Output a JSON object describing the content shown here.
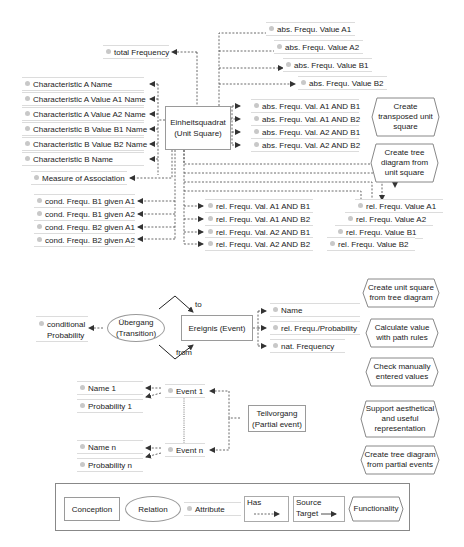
{
  "unit_square": {
    "concept": {
      "line1": "Einheitsquadrat",
      "line2": "(Unit Square)"
    },
    "total_frequency": "total Frequency",
    "characteristics": [
      "Characteristic A Name",
      "Characteristic A Value A1 Name",
      "Characteristic A Value A2 Name",
      "Characteristic B Value B1 Name",
      "Characteristic B Value B2 Name",
      "Characteristic B Name"
    ],
    "measure_of_association": "Measure of Association",
    "conditional": [
      "cond. Frequ. B1 given A1",
      "cond. Frequ. B1 given A2",
      "cond. Frequ. B2 given A1",
      "cond. Frequ. B2 given A2"
    ],
    "abs_values": [
      "abs. Frequ. Value A1",
      "abs. Frequ. Value A2",
      "abs. Frequ. Value B1",
      "abs. Frequ. Value B2"
    ],
    "abs_joint": [
      "abs. Frequ. Val. A1 AND B1",
      "abs. Frequ. Val. A1 AND B2",
      "abs. Frequ. Val. A2 AND B1",
      "abs. Frequ. Val. A2 AND B2"
    ],
    "rel_joint": [
      "rel. Frequ. Val. A1 AND B1",
      "rel. Frequ. Val. A1 AND B2",
      "rel. Frequ. Val. A2 AND B1",
      "rel. Frequ. Val. A2 AND B2"
    ],
    "rel_values": [
      "rel. Frequ. Value A1",
      "rel. Frequ. Value A2",
      "rel. Frequ. Value B1",
      "rel. Frequ. Value B2"
    ]
  },
  "functionalities": [
    {
      "line1": "Create",
      "line2": "transposed unit",
      "line3": "square"
    },
    {
      "line1": "Create tree",
      "line2": "diagram from",
      "line3": "unit square"
    },
    {
      "line1": "Create unit square",
      "line2": "from tree diagram"
    },
    {
      "line1": "Calculate value",
      "line2": "with path rules"
    },
    {
      "line1": "Check manually",
      "line2": "entered values"
    },
    {
      "line1": "Support aesthetical",
      "line2": "and useful",
      "line3": "representation"
    },
    {
      "line1": "Create tree diagram",
      "line2": "from partial events"
    }
  ],
  "tree": {
    "transition": {
      "line1": "Übergang",
      "line2": "(Transition)"
    },
    "conditional_probability": {
      "line1": "conditional",
      "line2": "Probability"
    },
    "event": {
      "label": "Ereignis (Event)"
    },
    "to_label": "to",
    "from_label": "from",
    "event_attrs": [
      "Name",
      "rel. Frequ./Probability",
      "nat. Frequency"
    ],
    "partial_event": {
      "line1": "Teilvorgang",
      "line2": "(Partial event)"
    },
    "event1": "Event 1",
    "eventn": "Event n",
    "event1_attrs": [
      "Name 1",
      "Probability 1"
    ],
    "eventn_attrs": [
      "Name n",
      "Probability n"
    ]
  },
  "legend": {
    "conception": "Conception",
    "relation": "Relation",
    "attribute": "Attribute",
    "has": "Has",
    "source": "Source",
    "target": "Target",
    "functionality": "Functionality"
  }
}
